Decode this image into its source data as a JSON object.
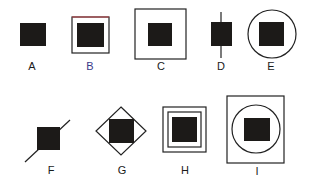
{
  "figure": {
    "title": "",
    "colors": {
      "ink": "#1a1a1a",
      "fill": "#1c1a18",
      "stroke": "#222222",
      "accent_red": "#c0454a",
      "accent_blue": "#3a3a8a",
      "background": "#ffffff"
    },
    "options": [
      {
        "label": "A",
        "description": "black square alone"
      },
      {
        "label": "B",
        "description": "black square inside a square outline"
      },
      {
        "label": "C",
        "description": "black square inside a larger square outline"
      },
      {
        "label": "D",
        "description": "black square with a vertical line through it"
      },
      {
        "label": "E",
        "description": "black square inside a circle"
      },
      {
        "label": "F",
        "description": "black square with a diagonal line through opposite corners"
      },
      {
        "label": "G",
        "description": "black square inside a diamond"
      },
      {
        "label": "H",
        "description": "black square inside two nested square outlines"
      },
      {
        "label": "I",
        "description": "black square inside a circle inside a rectangle"
      }
    ]
  }
}
